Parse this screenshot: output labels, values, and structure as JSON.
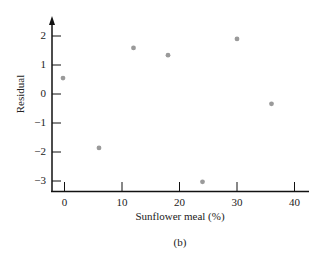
{
  "chart_data": {
    "type": "scatter",
    "title": "",
    "xlabel": "Sunflower meal (%)",
    "ylabel": "Residual",
    "caption": "(b)",
    "x": [
      0,
      6,
      12,
      18,
      24,
      30,
      36
    ],
    "y": [
      0.55,
      -1.86,
      1.59,
      1.34,
      -3.03,
      1.9,
      -0.34
    ],
    "xticks": [
      0,
      10,
      20,
      30,
      40
    ],
    "yticks": [
      2,
      1,
      0,
      -1,
      -2,
      -3
    ],
    "xlim": [
      -2,
      42
    ],
    "ylim": [
      -3.4,
      2.6
    ],
    "grid": false,
    "marker_color": "#9a9a9a"
  },
  "labels": {
    "xlabel": "Sunflower meal (%)",
    "ylabel": "Residual",
    "caption": "(b)",
    "xticks": [
      "0",
      "10",
      "20",
      "30",
      "40"
    ],
    "yticks": [
      "2",
      "1",
      "0",
      "−1",
      "−2",
      "−3"
    ]
  }
}
